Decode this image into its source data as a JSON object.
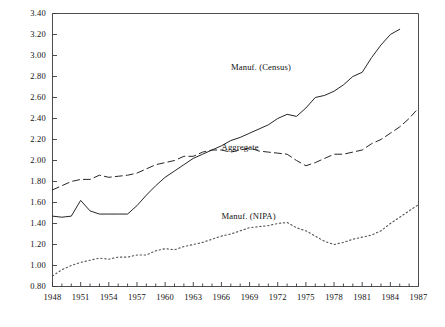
{
  "chart_data": {
    "type": "line",
    "title": "",
    "xlabel": "",
    "ylabel": "",
    "xlim": [
      1948,
      1987
    ],
    "ylim": [
      0.8,
      3.4
    ],
    "grid": false,
    "legend_position": "inline-annotations",
    "y_ticks": [
      "0.80",
      "1.00",
      "1.20",
      "1.40",
      "1.60",
      "1.80",
      "2.00",
      "2.20",
      "2.40",
      "2.60",
      "2.80",
      "3.00",
      "3.20",
      "3.40"
    ],
    "x_ticks": [
      "1948",
      "1951",
      "1954",
      "1957",
      "1960",
      "1963",
      "1966",
      "1969",
      "1972",
      "1975",
      "1978",
      "1981",
      "1984",
      "1987"
    ],
    "x_minor_step": 1,
    "series": [
      {
        "name": "Manuf. (Census)",
        "style": "solid",
        "color": "#1a1a1a",
        "label_x": 1970,
        "label_y": 2.88,
        "x": [
          1948,
          1949,
          1950,
          1951,
          1952,
          1953,
          1954,
          1955,
          1956,
          1957,
          1958,
          1959,
          1960,
          1961,
          1962,
          1963,
          1964,
          1965,
          1966,
          1967,
          1968,
          1969,
          1970,
          1971,
          1972,
          1973,
          1974,
          1975,
          1976,
          1977,
          1978,
          1979,
          1980,
          1981,
          1982,
          1983,
          1984,
          1985
        ],
        "values": [
          1.47,
          1.46,
          1.47,
          1.62,
          1.52,
          1.49,
          1.49,
          1.49,
          1.49,
          1.57,
          1.67,
          1.76,
          1.84,
          1.9,
          1.96,
          2.02,
          2.06,
          2.1,
          2.14,
          2.19,
          2.22,
          2.26,
          2.3,
          2.34,
          2.4,
          2.44,
          2.42,
          2.5,
          2.6,
          2.62,
          2.66,
          2.72,
          2.8,
          2.84,
          2.98,
          3.1,
          3.2,
          3.25
        ]
      },
      {
        "name": "Aggregate",
        "style": "dashed",
        "color": "#1a1a1a",
        "label_x": 1969,
        "label_y": 2.12,
        "x": [
          1948,
          1949,
          1950,
          1951,
          1952,
          1953,
          1954,
          1955,
          1956,
          1957,
          1958,
          1959,
          1960,
          1961,
          1962,
          1963,
          1964,
          1965,
          1966,
          1967,
          1968,
          1969,
          1970,
          1971,
          1972,
          1973,
          1974,
          1975,
          1976,
          1977,
          1978,
          1979,
          1980,
          1981,
          1982,
          1983,
          1984,
          1985,
          1986,
          1987
        ],
        "values": [
          1.72,
          1.76,
          1.8,
          1.82,
          1.82,
          1.86,
          1.84,
          1.85,
          1.86,
          1.88,
          1.92,
          1.96,
          1.98,
          2.0,
          2.04,
          2.04,
          2.08,
          2.1,
          2.1,
          2.08,
          2.1,
          2.12,
          2.09,
          2.08,
          2.07,
          2.06,
          2.0,
          1.95,
          1.98,
          2.02,
          2.06,
          2.06,
          2.08,
          2.1,
          2.16,
          2.2,
          2.26,
          2.32,
          2.4,
          2.5
        ]
      },
      {
        "name": "Manuf. (NIPA)",
        "style": "dotted",
        "color": "#555555",
        "label_x": 1969,
        "label_y": 1.46,
        "x": [
          1948,
          1949,
          1950,
          1951,
          1952,
          1953,
          1954,
          1955,
          1956,
          1957,
          1958,
          1959,
          1960,
          1961,
          1962,
          1963,
          1964,
          1965,
          1966,
          1967,
          1968,
          1969,
          1970,
          1971,
          1972,
          1973,
          1974,
          1975,
          1976,
          1977,
          1978,
          1979,
          1980,
          1981,
          1982,
          1983,
          1984,
          1985,
          1986,
          1987
        ],
        "values": [
          0.9,
          0.96,
          1.0,
          1.03,
          1.05,
          1.07,
          1.06,
          1.08,
          1.08,
          1.1,
          1.1,
          1.14,
          1.16,
          1.15,
          1.18,
          1.2,
          1.22,
          1.25,
          1.28,
          1.3,
          1.33,
          1.36,
          1.37,
          1.38,
          1.4,
          1.41,
          1.36,
          1.33,
          1.28,
          1.23,
          1.2,
          1.22,
          1.25,
          1.27,
          1.29,
          1.33,
          1.4,
          1.46,
          1.52,
          1.58
        ]
      }
    ]
  }
}
